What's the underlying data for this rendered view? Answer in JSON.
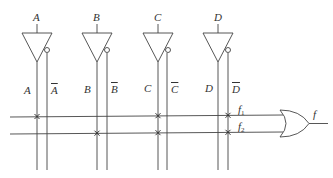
{
  "diagram": {
    "type": "PLA-style logic array",
    "inputs": [
      {
        "name": "A",
        "true_label": "A",
        "comp_label": "A"
      },
      {
        "name": "B",
        "true_label": "B",
        "comp_label": "B"
      },
      {
        "name": "C",
        "true_label": "C",
        "comp_label": "C"
      },
      {
        "name": "D",
        "true_label": "D",
        "comp_label": "D"
      }
    ],
    "product_terms": [
      {
        "label": "f",
        "sub": "1",
        "connections": [
          "A",
          "C",
          "D̄"
        ]
      },
      {
        "label": "f",
        "sub": "2",
        "connections": [
          "B",
          "C",
          "D̄"
        ]
      }
    ],
    "output": {
      "label": "f",
      "gate": "OR"
    },
    "colors": {
      "line": "#444444",
      "background": "#ffffff"
    }
  }
}
